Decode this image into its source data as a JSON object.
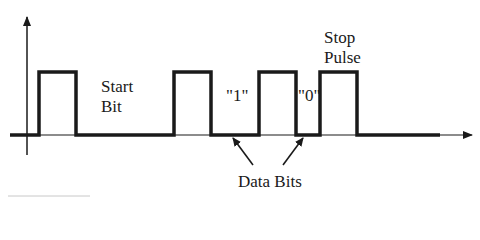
{
  "diagram": {
    "type": "serial-pulse-timing-diagram",
    "axes": {
      "y_axis": {
        "x": 27,
        "y_top": 15,
        "y_bottom": 155,
        "arrow": true
      },
      "x_axis": {
        "y": 135,
        "x_left": 10,
        "x_right": 472,
        "arrow": true
      }
    },
    "signal": {
      "low_y": 135,
      "high_y": 72,
      "color": "#1a1a1a",
      "pulses": [
        {
          "name": "pulse-1",
          "x_start": 39,
          "x_end": 76
        },
        {
          "name": "pulse-2",
          "x_start": 174,
          "x_end": 211
        },
        {
          "name": "pulse-3",
          "x_start": 259,
          "x_end": 296
        },
        {
          "name": "pulse-4-stop",
          "x_start": 320,
          "x_end": 357
        }
      ],
      "thick_end_x": 440
    },
    "labels": {
      "start_bit_line1": "Start",
      "start_bit_line2": "Bit",
      "bit_one": "\"1\"",
      "bit_zero": "\"0\"",
      "stop_pulse_line1": "Stop",
      "stop_pulse_line2": "Pulse",
      "data_bits": "Data Bits"
    },
    "pointer_arrows": [
      {
        "name": "data-bit-1-arrow",
        "from": [
          253,
          165
        ],
        "to": [
          232,
          137
        ]
      },
      {
        "name": "data-bit-0-arrow",
        "from": [
          283,
          165
        ],
        "to": [
          304,
          137
        ]
      }
    ]
  }
}
